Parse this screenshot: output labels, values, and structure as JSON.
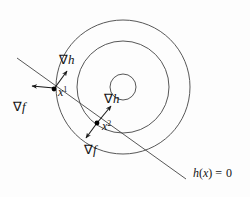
{
  "figure": {
    "background_color": "#fdfdfd",
    "stroke_color": "#444444",
    "label_color": "#141414"
  },
  "contours": {
    "description": "Three concentric circular level sets of f",
    "center": {
      "x": 123,
      "y": 87
    },
    "radii": [
      13,
      46,
      67
    ]
  },
  "constraint": {
    "label": "h(x) = 0",
    "label_text_h": "h",
    "label_text_paren_open": "(",
    "label_text_x": "x",
    "label_text_paren_close": ")",
    "label_text_equals": "=",
    "label_text_zero": "0",
    "line": {
      "x1": 17,
      "y1": 58,
      "x2": 186,
      "y2": 179
    }
  },
  "points": [
    {
      "id": "x1",
      "label_base": "x",
      "label_sup": "1",
      "dot": {
        "x": 54,
        "y": 89
      },
      "label_pos": {
        "x": 58,
        "y": 96
      },
      "gradients": [
        {
          "name": "grad-h",
          "symbol": "∇",
          "fn": "h",
          "from": {
            "x": 54,
            "y": 89
          },
          "to": {
            "x": 67,
            "y": 71
          },
          "label_pos": {
            "x": 59,
            "y": 64
          }
        },
        {
          "name": "grad-f",
          "symbol": "∇",
          "fn": "f",
          "from": {
            "x": 54,
            "y": 88
          },
          "to": {
            "x": 32,
            "y": 86
          },
          "label_pos": {
            "x": 13,
            "y": 111
          }
        }
      ]
    },
    {
      "id": "x2",
      "label_base": "x",
      "label_sup": "2",
      "dot": {
        "x": 97,
        "y": 123
      },
      "label_pos": {
        "x": 102,
        "y": 130
      },
      "gradients": [
        {
          "name": "grad-h",
          "symbol": "∇",
          "fn": "h",
          "from": {
            "x": 97,
            "y": 123
          },
          "to": {
            "x": 111,
            "y": 106
          },
          "label_pos": {
            "x": 104,
            "y": 103
          }
        },
        {
          "name": "grad-f",
          "symbol": "∇",
          "fn": "f",
          "from": {
            "x": 97,
            "y": 123
          },
          "to": {
            "x": 86,
            "y": 138
          },
          "label_pos": {
            "x": 84,
            "y": 154
          }
        }
      ]
    }
  ]
}
